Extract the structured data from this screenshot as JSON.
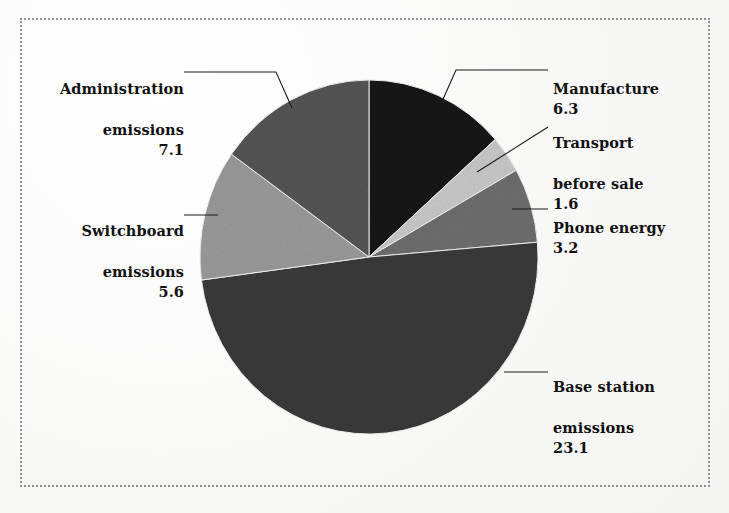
{
  "figure": {
    "border_style": "dotted",
    "border_color": "#8e8e90",
    "background_color": "#fbfbfa"
  },
  "chart_data": {
    "type": "pie",
    "title": "",
    "subtitle": "",
    "xlabel": "",
    "ylabel": "",
    "legend_position": "none",
    "grid": false,
    "total": 46.9,
    "start_angle_deg": 0,
    "direction": "clockwise",
    "categories": [
      "Manufacture",
      "Transport before sale",
      "Phone energy",
      "Base station emissions",
      "Switchboard emissions",
      "Administration emissions"
    ],
    "values": [
      6.3,
      1.6,
      3.2,
      23.1,
      5.6,
      7.1
    ],
    "colors": [
      "#141414",
      "#c8c8c8",
      "#6e6e6e",
      "#3a3a3a",
      "#9a9a9a",
      "#555555"
    ],
    "slices": [
      {
        "label": "Manufacture",
        "label_line1": "Manufacture",
        "label_line2": "",
        "value": 6.3,
        "value_text": "6.3",
        "color": "#141414",
        "percent": 13.4,
        "angle_deg": 48.4,
        "label_side": "right"
      },
      {
        "label": "Transport before sale",
        "label_line1": "Transport",
        "label_line2": "before sale",
        "value": 1.6,
        "value_text": "1.6",
        "color": "#c8c8c8",
        "percent": 3.4,
        "angle_deg": 12.3,
        "label_side": "right"
      },
      {
        "label": "Phone energy",
        "label_line1": "Phone energy",
        "label_line2": "",
        "value": 3.2,
        "value_text": "3.2",
        "color": "#6e6e6e",
        "percent": 6.8,
        "angle_deg": 24.6,
        "label_side": "right"
      },
      {
        "label": "Base station emissions",
        "label_line1": "Base station",
        "label_line2": "emissions",
        "value": 23.1,
        "value_text": "23.1",
        "color": "#3a3a3a",
        "percent": 49.3,
        "angle_deg": 177.3,
        "label_side": "right"
      },
      {
        "label": "Switchboard emissions",
        "label_line1": "Switchboard",
        "label_line2": "emissions",
        "value": 5.6,
        "value_text": "5.6",
        "color": "#9a9a9a",
        "percent": 11.9,
        "angle_deg": 43.0,
        "label_side": "left"
      },
      {
        "label": "Administration emissions",
        "label_line1": "Administration",
        "label_line2": "emissions",
        "value": 7.1,
        "value_text": "7.1",
        "color": "#555555",
        "percent": 15.1,
        "angle_deg": 54.5,
        "label_side": "left"
      }
    ]
  }
}
